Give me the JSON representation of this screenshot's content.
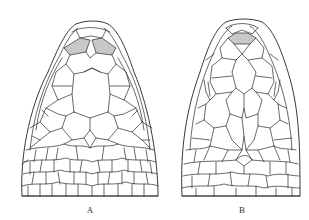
{
  "figure": {
    "panels": [
      {
        "id": "A",
        "label": "A",
        "description": "dorsal view of snake head with paired shaded prefrontal scales and fragmented head scales"
      },
      {
        "id": "B",
        "label": "B",
        "description": "dorsal view of snake head with single shaded internasal scale and enlarged head shields"
      }
    ],
    "colors": {
      "line": "#2a2a2a",
      "shade": "#c8c8c8",
      "background": "#ffffff"
    }
  }
}
